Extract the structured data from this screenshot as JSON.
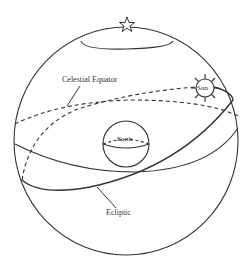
{
  "diagram": {
    "labels": {
      "celestial_equator": "Celestial Equator",
      "ecliptic": "Ecliptic",
      "earth": "Earth",
      "sun": "Sun"
    },
    "icons": {
      "pole_star": "star-icon",
      "sun": "sun-icon"
    },
    "colors": {
      "line": "#333333",
      "background": "#ffffff"
    }
  }
}
